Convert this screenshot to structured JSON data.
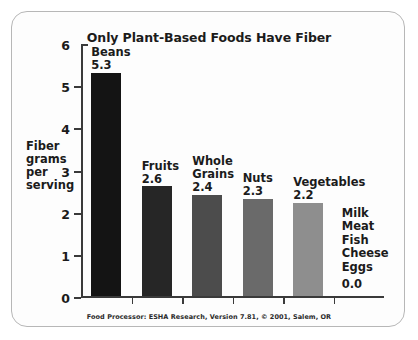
{
  "chart_data": {
    "type": "bar",
    "title": "Only Plant-Based Foods Have Fiber",
    "xlabel": "",
    "ylabel": "Fiber grams per serving",
    "ylim": [
      0,
      6
    ],
    "yticks": [
      0,
      1,
      2,
      3,
      4,
      5,
      6
    ],
    "grid": false,
    "legend": null,
    "categories": [
      "Beans",
      "Fruits",
      "Whole Grains",
      "Nuts",
      "Vegetables",
      "Milk Meat Fish Cheese Eggs"
    ],
    "values": [
      5.3,
      2.6,
      2.4,
      2.3,
      2.2,
      0.0
    ],
    "value_labels": [
      "5.3",
      "2.6",
      "2.4",
      "2.3",
      "2.2",
      "0.0"
    ],
    "bar_colors": [
      "#141414",
      "#262626",
      "#4c4c4c",
      "#6a6a6a",
      "#8e8e8e",
      "none"
    ],
    "annotations": [
      "Food Processor: ESHA Research, Version 7.81, © 2001, Salem, OR"
    ],
    "bars": [
      {
        "label": "Beans",
        "label_lines": [
          "Beans"
        ],
        "value": 5.3,
        "value_label": "5.3",
        "color": "#141414"
      },
      {
        "label": "Fruits",
        "label_lines": [
          "Fruits"
        ],
        "value": 2.6,
        "value_label": "2.6",
        "color": "#262626"
      },
      {
        "label": "Whole Grains",
        "label_lines": [
          "Whole",
          "Grains"
        ],
        "value": 2.4,
        "value_label": "2.4",
        "color": "#4c4c4c"
      },
      {
        "label": "Nuts",
        "label_lines": [
          "Nuts"
        ],
        "value": 2.3,
        "value_label": "2.3",
        "color": "#6a6a6a"
      },
      {
        "label": "Vegetables",
        "label_lines": [
          "Vegetables"
        ],
        "value": 2.2,
        "value_label": "2.2",
        "color": "#8e8e8e"
      }
    ],
    "no_fiber_group": {
      "items": [
        "Milk",
        "Meat",
        "Fish",
        "Cheese",
        "Eggs"
      ],
      "value_label": "0.0"
    }
  },
  "axis": {
    "y_title_lines": [
      "Fiber",
      "grams",
      "per",
      "serving"
    ],
    "y_tick_labels": [
      "6",
      "5",
      "4",
      "3",
      "2",
      "1",
      "0"
    ]
  },
  "source": {
    "note": "Food Processor: ESHA Research, Version 7.81, © 2001, Salem, OR"
  }
}
